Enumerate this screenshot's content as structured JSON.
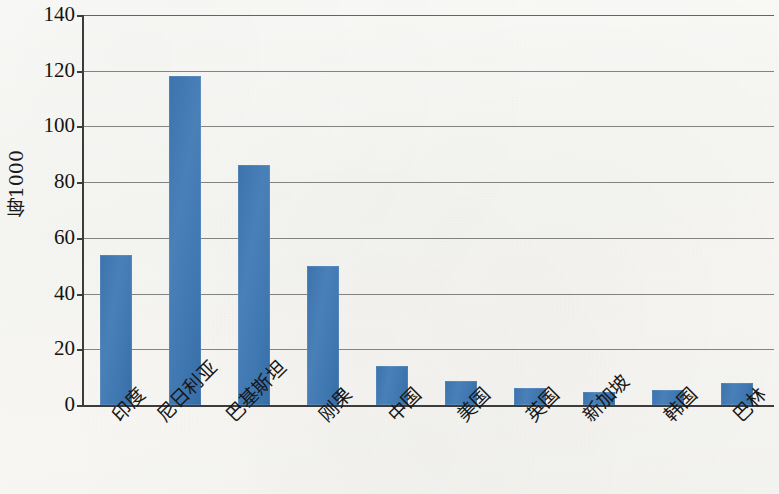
{
  "chart_data": {
    "type": "bar",
    "title": "",
    "subtitle": "",
    "xlabel": "",
    "ylabel": "每1000",
    "ylim": [
      0,
      140
    ],
    "yticks": [
      0,
      20,
      40,
      60,
      80,
      100,
      120,
      140
    ],
    "grid": true,
    "legend": null,
    "bar_color": "#3f77b1",
    "axis_color": "#3c3c3c",
    "categories": [
      "印度",
      "尼日利亚",
      "巴基斯坦",
      "刚果",
      "中国",
      "美国",
      "英国",
      "新加坡",
      "韩国",
      "巴林"
    ],
    "values": [
      54,
      118,
      86,
      50,
      14,
      8.5,
      6,
      4.5,
      5.5,
      8
    ]
  }
}
